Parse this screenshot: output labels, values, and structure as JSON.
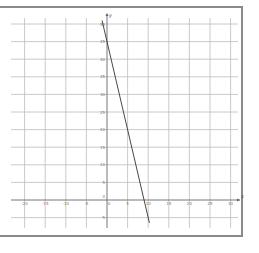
{
  "chart_data": {
    "type": "line",
    "title": "",
    "xlabel": "x",
    "ylabel": "y",
    "xlim": [
      -23,
      31
    ],
    "ylim": [
      -8,
      52
    ],
    "grid": true,
    "x_ticks": [
      -20,
      -15,
      -10,
      -5,
      0,
      5,
      10,
      15,
      20,
      25,
      30
    ],
    "y_ticks": [
      -5,
      0,
      5,
      10,
      15,
      20,
      25,
      30,
      35,
      40,
      45,
      50
    ],
    "x_tick_labels": [
      "-20",
      "-15",
      "-10",
      "-5",
      "0",
      "5",
      "10",
      "15",
      "20",
      "25",
      "30"
    ],
    "y_tick_labels": [
      "-5",
      "0",
      "5",
      "10",
      "15",
      "20",
      "25",
      "30",
      "35",
      "40",
      "45",
      "50"
    ],
    "series": [
      {
        "name": "y = -5x + 45",
        "equation": "y = -5x + 45",
        "x": [
          -1.2,
          10.3
        ],
        "y": [
          51,
          -6.5
        ],
        "color": "#333333"
      }
    ],
    "legend": null
  },
  "colors": {
    "grid": "#bdbdbd",
    "axis": "#666666",
    "frame": "#8a8a8a",
    "line": "#333333"
  }
}
